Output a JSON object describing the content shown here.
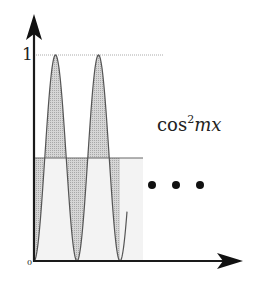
{
  "figure": {
    "function_label": "cos",
    "function_exponent": "2",
    "function_arg": "mx",
    "y_tick_one": "1",
    "y_tick_zero": "0",
    "ellipsis_dots": 3,
    "colors": {
      "axis": "#1a1a1a",
      "curve": "#555555",
      "shade_dark": "#b8b8b8",
      "shade_light": "#eeeeee",
      "guide": "#999999"
    }
  },
  "chart_data": {
    "type": "line",
    "title": "",
    "annotation": "cos^2 mx",
    "xlabel": "",
    "ylabel": "",
    "y_ticks": [
      0,
      1
    ],
    "ylim": [
      0,
      1
    ],
    "reference_line": 0.5,
    "series": [
      {
        "name": "cos^2 mx (shifted, starts at 0)",
        "x": [
          0,
          0.25,
          0.5,
          0.75,
          1.0,
          1.25,
          1.5,
          1.75,
          2.0,
          2.16
        ],
        "values": [
          0,
          0.5,
          1,
          0.5,
          0,
          0.5,
          1,
          0.5,
          0,
          0.6
        ]
      }
    ],
    "shading": "regions between curve and y=0.5 line shaded; light rectangle under y=0.5 indicates average value",
    "continuation": "three dots indicate pattern continues"
  }
}
